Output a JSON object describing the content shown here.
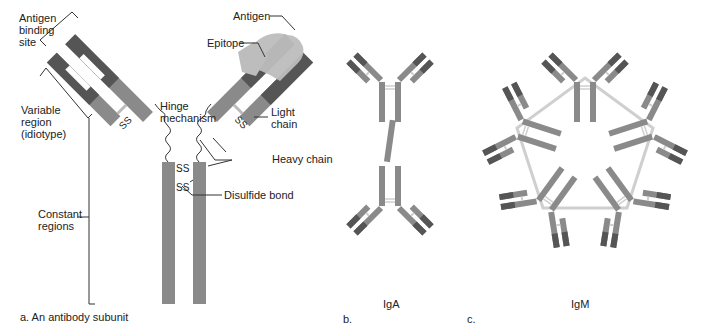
{
  "colors": {
    "constant": "#8a8a8a",
    "variable": "#555555",
    "antigen": "#bdbdbd",
    "line": "#333333",
    "bridge": "#cfcfcf"
  },
  "panel_a": {
    "caption": "a. An antibody subunit",
    "labels": {
      "antigen_binding_site": "Antigen\nbinding\nsite",
      "variable_region": "Variable\nregion\n(idiotype)",
      "constant_regions": "Constant\nregions",
      "hinge": "Hinge\nmechanism",
      "antigen": "Antigen",
      "epitope": "Epitope",
      "light_chain": "Light\nchain",
      "heavy_chain": "Heavy chain",
      "disulfide_bond": "Disulfide bond",
      "ss": "SS"
    }
  },
  "panel_b": {
    "caption": "b.",
    "title": "IgA"
  },
  "panel_c": {
    "caption": "c.",
    "title": "IgM"
  }
}
